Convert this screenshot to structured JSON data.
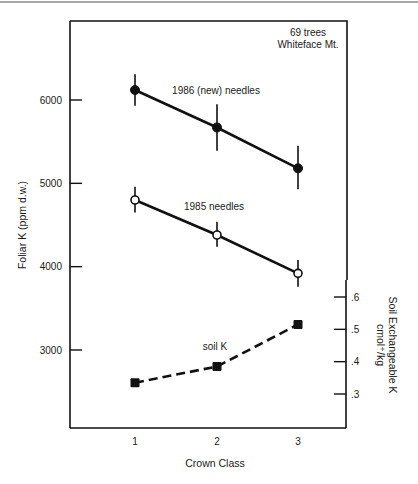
{
  "chart_data": {
    "type": "line",
    "title": "",
    "annotation": [
      "69 trees",
      "Whiteface Mt."
    ],
    "xlabel": "Crown Class",
    "ylabel": "Foliar K (ppm d.w.)",
    "y2label": [
      "Soil Exchangeable K",
      "cmol⁺/kg"
    ],
    "categories": [
      "1",
      "2",
      "3"
    ],
    "x": [
      1,
      2,
      3
    ],
    "yticks": [
      3000,
      4000,
      5000,
      6000
    ],
    "ytick_labels": [
      "3000",
      "4000",
      "5000",
      "6000"
    ],
    "y2ticks": [
      0.3,
      0.4,
      0.5,
      0.6
    ],
    "y2tick_labels": [
      ".3",
      ".4",
      ".5",
      ".6"
    ],
    "grid": false,
    "legend": "inline labels",
    "series": [
      {
        "name": "1986 (new) needles",
        "axis": "left",
        "marker": "filled-circle",
        "line": "solid",
        "values": [
          6120,
          5670,
          5180
        ],
        "error_low": [
          5930,
          5390,
          4930
        ],
        "error_high": [
          6310,
          5950,
          5450
        ]
      },
      {
        "name": "1985 needles",
        "axis": "left",
        "marker": "open-circle",
        "line": "solid",
        "values": [
          4800,
          4380,
          3920
        ],
        "error_low": [
          4650,
          4240,
          3760
        ],
        "error_high": [
          4960,
          4540,
          4080
        ]
      },
      {
        "name": "soil K",
        "axis": "right",
        "marker": "filled-square",
        "line": "dashed",
        "values": [
          0.335,
          0.385,
          0.515
        ]
      }
    ]
  },
  "layout": {
    "plot": {
      "left": 70,
      "right": 346,
      "top": 21,
      "bottom": 428
    },
    "x_px": [
      135,
      217,
      298
    ],
    "y_left": {
      "v0": 6000,
      "p0": 100,
      "v1": 3000,
      "p1": 350
    },
    "y_right": {
      "v0": 0.6,
      "p0": 297,
      "v1": 0.3,
      "p1": 394
    },
    "y_right_axis_top": 280,
    "colors": {
      "ink": "#111111",
      "top_rule": "#8a8a8a"
    }
  }
}
